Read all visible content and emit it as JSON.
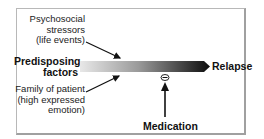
{
  "diagram": {
    "type": "causal-flow",
    "nodes": {
      "stressors": {
        "lines": [
          "Psychosocial",
          "stressors",
          "(life events)"
        ]
      },
      "predisposing": {
        "lines": [
          "Predisposing",
          "factors"
        ]
      },
      "family": {
        "lines": [
          "Family of patient",
          "(high expressed",
          "emotion)"
        ]
      },
      "relapse": {
        "label": "Relapse"
      },
      "medication": {
        "label": "Medication"
      },
      "inhibit_symbol": {
        "label": "−"
      }
    },
    "colors": {
      "bar_start": "#e6e6e6",
      "bar_end": "#111111",
      "frame": "#b0b0b0",
      "text": "#222222"
    }
  }
}
